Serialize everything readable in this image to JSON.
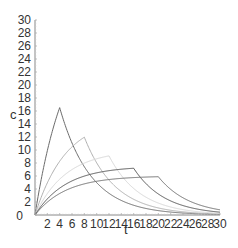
{
  "chart_data": {
    "type": "line",
    "title": "",
    "xlabel": "t",
    "ylabel": "c",
    "xlim": [
      0,
      30
    ],
    "ylim": [
      0,
      30
    ],
    "x_ticks": [
      2,
      4,
      6,
      8,
      10,
      12,
      14,
      16,
      18,
      20,
      22,
      24,
      26,
      28,
      30
    ],
    "y_ticks": [
      0,
      2,
      4,
      6,
      8,
      10,
      12,
      14,
      16,
      18,
      20,
      22,
      24,
      26,
      28,
      30
    ],
    "grid": false,
    "legend": null,
    "model": {
      "description": "infusion of duration T then exponential decay",
      "k": 0.2,
      "dose_over_k": 120
    },
    "series": [
      {
        "name": "T=4",
        "infusion_end": 4,
        "peak": 16.5,
        "color": "#6b6b6b",
        "width": 1.0
      },
      {
        "name": "T=8",
        "infusion_end": 8,
        "peak": 12.0,
        "color": "#b0b0b0",
        "width": 1.0
      },
      {
        "name": "T=12",
        "infusion_end": 12,
        "peak": 9.1,
        "color": "#d8d8d8",
        "width": 1.0
      },
      {
        "name": "T=16",
        "infusion_end": 16,
        "peak": 7.2,
        "color": "#555555",
        "width": 1.0
      },
      {
        "name": "T=20",
        "infusion_end": 20,
        "peak": 5.9,
        "color": "#707070",
        "width": 1.0
      }
    ]
  },
  "labels": {
    "x_axis": "t",
    "y_axis": "c"
  }
}
